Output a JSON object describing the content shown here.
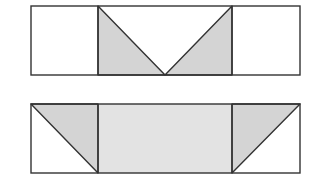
{
  "figure": {
    "colors": {
      "stroke": "#333333",
      "triangle_fill": "#d4d4d4",
      "center_fill": "#e3e3e3",
      "background": "#ffffff"
    },
    "top_strip": {
      "x": 31,
      "y": 6,
      "width": 269,
      "height": 69,
      "dividers_x": [
        98,
        232
      ],
      "shaded_triangles": [
        {
          "points": "98,6 98,75 165,75"
        },
        {
          "points": "232,6 232,75 165,75"
        }
      ]
    },
    "bottom_strip": {
      "x": 31,
      "y": 104,
      "width": 269,
      "height": 69,
      "dividers_x": [
        98,
        232
      ],
      "center_shaded": {
        "x": 98,
        "y": 104,
        "width": 134,
        "height": 69
      },
      "shaded_triangles": [
        {
          "points": "31,104 98,104 98,173"
        },
        {
          "points": "232,104 300,104 232,173"
        }
      ]
    }
  }
}
